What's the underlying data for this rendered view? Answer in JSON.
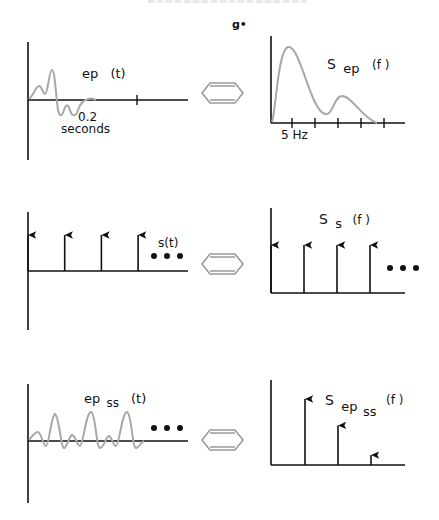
{
  "stray_mark": "g•",
  "equivalence_icon": "double-headed-arrow",
  "colors": {
    "axis": "#111111",
    "curve": "#a8a8a8",
    "arrow_outline": "#9a9a9a"
  },
  "rows": [
    {
      "name": "evoked-potential",
      "time": {
        "label_main": "ep",
        "label_sub": "",
        "label_arg": "(t)",
        "tick_label_value": "0.2",
        "tick_label_unit": "seconds"
      },
      "freq": {
        "label_main": "S",
        "label_sub": "ep",
        "label_sub2": "",
        "label_arg": "(f )",
        "tick_label": "5  Hz",
        "tick_count": 5
      }
    },
    {
      "name": "sampling-train",
      "time": {
        "label_main": "s(t)",
        "impulse_count": 4,
        "continuation": "• • •"
      },
      "freq": {
        "label_main": "S",
        "label_sub": "s",
        "label_arg": "(f )",
        "impulse_count": 4,
        "continuation": "• • •"
      }
    },
    {
      "name": "steady-state-ep",
      "time": {
        "label_main": "ep",
        "label_sub": "ss",
        "label_arg": "(t)",
        "continuation": "• • •"
      },
      "freq": {
        "label_main": "S",
        "label_sub": "ep",
        "label_sub2": "ss",
        "label_arg": "(f )",
        "impulse_relative_heights": [
          1.0,
          0.6,
          0.15
        ]
      }
    }
  ]
}
